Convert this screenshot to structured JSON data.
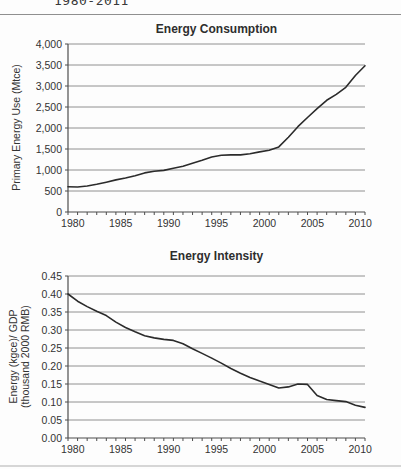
{
  "page": {
    "partial_caption": "1980-2011"
  },
  "colors": {
    "data_line": "#2b2b2b",
    "gridline": "#909090",
    "axis": "#4d4d4d",
    "text": "#333333",
    "top_rule": "#8f8f8f",
    "bottom_rule": "#d6d6d6",
    "background": "#fdfdfd"
  },
  "chart_data": [
    {
      "type": "line",
      "title": "Energy Consumption",
      "ylabel_lines": [
        "Primary Energy Use (Mtce)"
      ],
      "xlabel": "",
      "legend": "none",
      "grid": "horizontal",
      "xlim": [
        1980,
        2011
      ],
      "ylim": [
        0,
        4000
      ],
      "ytick_step": 500,
      "ytick_labels": [
        "0",
        "500",
        "1,000",
        "1,500",
        "2,000",
        "2,500",
        "3,000",
        "3,500",
        "4,000"
      ],
      "xtick_labels": [
        "1980",
        "1985",
        "1990",
        "1995",
        "2000",
        "2005",
        "2010"
      ],
      "x": [
        1980,
        1981,
        1982,
        1983,
        1984,
        1985,
        1986,
        1987,
        1988,
        1989,
        1990,
        1991,
        1992,
        1993,
        1994,
        1995,
        1996,
        1997,
        1998,
        1999,
        2000,
        2001,
        2002,
        2003,
        2004,
        2005,
        2006,
        2007,
        2008,
        2009,
        2010,
        2011
      ],
      "values": [
        600,
        595,
        620,
        660,
        710,
        765,
        810,
        865,
        930,
        970,
        990,
        1040,
        1090,
        1160,
        1230,
        1310,
        1350,
        1360,
        1360,
        1385,
        1430,
        1470,
        1550,
        1780,
        2030,
        2250,
        2460,
        2660,
        2800,
        2970,
        3250,
        3480
      ]
    },
    {
      "type": "line",
      "title": "Energy Intensity",
      "ylabel_lines": [
        "Energy (kgce)/ GDP",
        "(thousand 2000 RMB)"
      ],
      "xlabel": "",
      "legend": "none",
      "grid": "horizontal",
      "xlim": [
        1980,
        2011
      ],
      "ylim": [
        0,
        0.45
      ],
      "ytick_step": 0.05,
      "ytick_labels": [
        "0.00",
        "0.05",
        "0.10",
        "0.15",
        "0.20",
        "0.25",
        "0.30",
        "0.35",
        "0.40",
        "0.45"
      ],
      "xtick_labels": [
        "1980",
        "1985",
        "1990",
        "1995",
        "2000",
        "2005",
        "2010"
      ],
      "x": [
        1980,
        1981,
        1982,
        1983,
        1984,
        1985,
        1986,
        1987,
        1988,
        1989,
        1990,
        1991,
        1992,
        1993,
        1994,
        1995,
        1996,
        1997,
        1998,
        1999,
        2000,
        2001,
        2002,
        2003,
        2004,
        2005,
        2006,
        2007,
        2008,
        2009,
        2010,
        2011
      ],
      "values": [
        0.4,
        0.38,
        0.365,
        0.352,
        0.34,
        0.322,
        0.307,
        0.295,
        0.284,
        0.278,
        0.274,
        0.271,
        0.262,
        0.248,
        0.235,
        0.222,
        0.208,
        0.193,
        0.18,
        0.168,
        0.158,
        0.149,
        0.139,
        0.142,
        0.15,
        0.149,
        0.118,
        0.107,
        0.104,
        0.101,
        0.091,
        0.085
      ]
    }
  ]
}
